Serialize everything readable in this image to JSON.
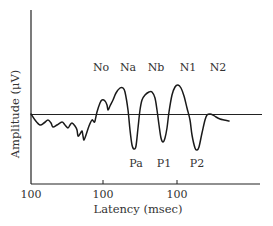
{
  "chart_data": {
    "type": "line",
    "title": "",
    "xlabel": "Latency (msec)",
    "ylabel": "Amplitude (μV)",
    "x_tick_labels": [
      "100",
      "100",
      "100"
    ],
    "grid": false,
    "legend": null,
    "baseline": "horizontal zero line at mid amplitude",
    "peak_labels_top": [
      "No",
      "Na",
      "Nb",
      "N1",
      "N2"
    ],
    "peak_labels_bottom": [
      "Pa",
      "P1",
      "P2"
    ],
    "series": [
      {
        "name": "Evoked potential waveform",
        "points_px": [
          [
            31,
            114
          ],
          [
            35,
            120
          ],
          [
            40,
            125
          ],
          [
            44,
            123
          ],
          [
            48,
            120
          ],
          [
            51,
            123
          ],
          [
            53,
            127
          ],
          [
            57,
            125
          ],
          [
            62,
            122
          ],
          [
            65,
            125
          ],
          [
            68,
            128
          ],
          [
            70,
            125
          ],
          [
            72,
            123
          ],
          [
            75,
            126
          ],
          [
            77,
            130
          ],
          [
            78,
            136
          ],
          [
            80,
            134
          ],
          [
            82,
            131
          ],
          [
            83,
            136
          ],
          [
            84,
            140
          ],
          [
            86,
            135
          ],
          [
            89,
            126
          ],
          [
            92,
            120
          ],
          [
            94,
            122
          ],
          [
            95,
            121
          ],
          [
            97,
            112
          ],
          [
            100,
            103
          ],
          [
            102,
            100
          ],
          [
            105,
            101
          ],
          [
            107,
            105
          ],
          [
            108,
            110
          ],
          [
            110,
            106
          ],
          [
            113,
            100
          ],
          [
            116,
            93
          ],
          [
            120,
            88
          ],
          [
            123,
            88
          ],
          [
            125,
            92
          ],
          [
            128,
            110
          ],
          [
            130,
            130
          ],
          [
            132,
            145
          ],
          [
            134,
            149
          ],
          [
            136,
            146
          ],
          [
            138,
            128
          ],
          [
            140,
            110
          ],
          [
            142,
            100
          ],
          [
            145,
            95
          ],
          [
            149,
            92
          ],
          [
            152,
            92
          ],
          [
            155,
            98
          ],
          [
            157,
            110
          ],
          [
            159,
            125
          ],
          [
            161,
            138
          ],
          [
            163,
            142
          ],
          [
            165,
            138
          ],
          [
            167,
            128
          ],
          [
            169,
            112
          ],
          [
            172,
            95
          ],
          [
            175,
            87
          ],
          [
            178,
            85
          ],
          [
            181,
            88
          ],
          [
            184,
            96
          ],
          [
            187,
            108
          ],
          [
            190,
            120
          ],
          [
            192,
            135
          ],
          [
            195,
            148
          ],
          [
            197,
            150
          ],
          [
            199,
            147
          ],
          [
            202,
            133
          ],
          [
            205,
            120
          ],
          [
            207,
            115
          ],
          [
            210,
            114
          ],
          [
            213,
            115
          ],
          [
            216,
            117
          ],
          [
            220,
            119
          ],
          [
            224,
            120
          ],
          [
            229,
            121
          ]
        ]
      }
    ]
  },
  "labels": {
    "ylabel": "Amplitude (μV)",
    "xlabel": "Latency (msec)",
    "ticks": [
      "100",
      "100",
      "100"
    ],
    "top": [
      "No",
      "Na",
      "Nb",
      "N1",
      "N2"
    ],
    "bottom": [
      "Pa",
      "P1",
      "P2"
    ]
  },
  "colors": {
    "axis": "#222222",
    "curve": "#1a1a1a",
    "text": "#333333"
  }
}
